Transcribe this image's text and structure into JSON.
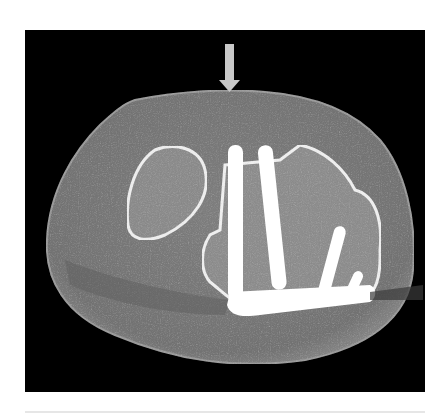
{
  "figure": {
    "type": "CT axial scan",
    "annotation": {
      "arrow": "down-arrow",
      "color": "#c8c8c8"
    },
    "colors": {
      "background": "#000000",
      "soft_tissue": "#7a7a7a",
      "bone_cortex": "#f0f0f0",
      "bone_marrow": "#8e8e8e",
      "hardware": "#ffffff"
    }
  }
}
